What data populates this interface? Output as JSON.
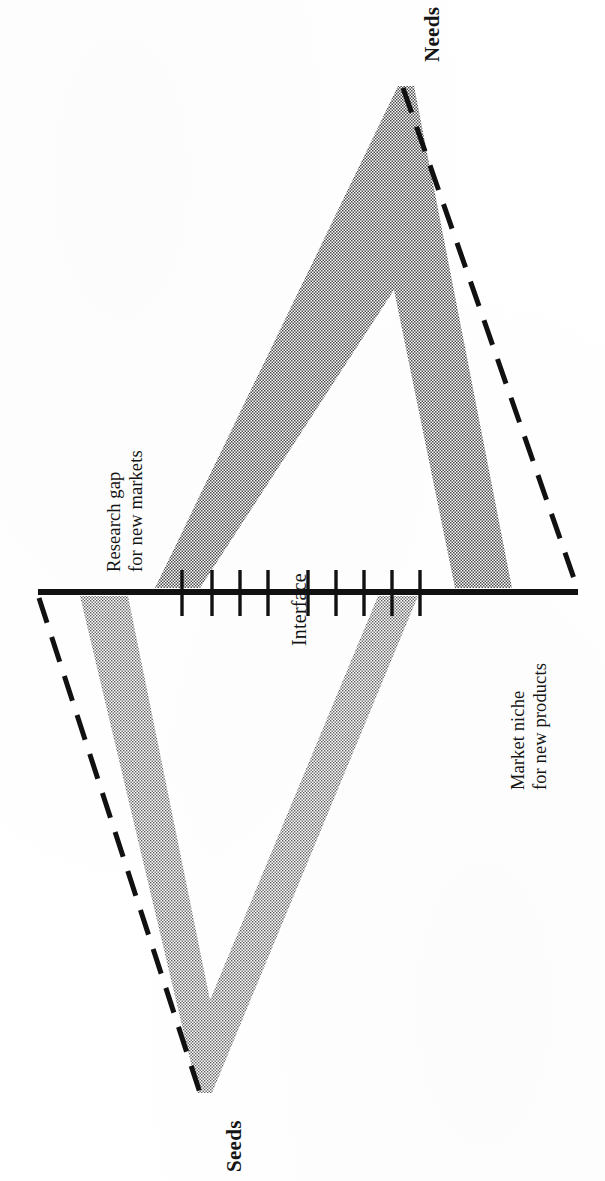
{
  "figure": {
    "title_hidden": "",
    "labels": {
      "needs": "Needs",
      "seeds": "Seeds",
      "interface": "Interface",
      "research_gap_line1": "Research gap",
      "research_gap_line2": "for new markets",
      "market_niche_line1": "Market niche",
      "market_niche_line2": "for new products"
    },
    "colors": {
      "ink": "#141414",
      "band_fill": "#8d8d8d",
      "paper": "#ffffff"
    },
    "geometry": {
      "orientation_deg": 90,
      "interface_line": {
        "x1": 38,
        "y1": 592,
        "x2": 578,
        "y2": 592,
        "stroke_width": 5
      },
      "needs_apex": {
        "x": 400,
        "y": 86
      },
      "seeds_apex": {
        "x": 200,
        "y": 1095
      },
      "needs_dashed_end": {
        "x": 578,
        "y": 590
      },
      "seeds_dashed_end": {
        "x": 39,
        "y": 596
      }
    },
    "ticks": {
      "left_group_count": 4,
      "right_group_count": 5,
      "total_count": 9,
      "left_group_x": [
        182,
        213,
        240,
        268
      ],
      "right_group_x": [
        308,
        336,
        365,
        392,
        420
      ],
      "tick_height_above": 22,
      "tick_height_below": 22
    },
    "bands": [
      {
        "name": "needs-band",
        "description": "stippled V-band inside upper (Needs) triangle",
        "base_left_x": 155,
        "base_right_x": 200,
        "foot_left_x": 455,
        "foot_right_x": 512
      },
      {
        "name": "seeds-band",
        "description": "stippled V-band inside lower (Seeds) triangle",
        "base_left_x": 80,
        "base_right_x": 128,
        "foot_left_x": 378,
        "foot_right_x": 418
      }
    ]
  }
}
